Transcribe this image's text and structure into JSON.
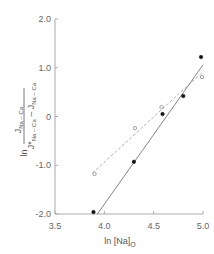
{
  "chart_data": {
    "type": "scatter",
    "title": "",
    "xlabel": "ln [Na]o",
    "ylabel": "ln (J_Na-Ca / (J*_Na-Ca − J_Na-Ca))",
    "xlim": [
      3.5,
      5.0
    ],
    "ylim": [
      -2.0,
      2.0
    ],
    "x_ticks": [
      "3.5",
      "4.0",
      "4.5",
      "5.0"
    ],
    "y_ticks": [
      "2.0",
      "1.0",
      "0",
      "-1.0",
      "-2.0"
    ],
    "grid": false,
    "legend": null,
    "series": [
      {
        "name": "filled circles (solid fit line)",
        "marker": "filled-circle",
        "line": "solid",
        "x": [
          3.89,
          4.3,
          4.59,
          4.8,
          4.98
        ],
        "y": [
          -1.96,
          -0.93,
          0.05,
          0.42,
          1.22
        ],
        "fit": {
          "x": [
            3.93,
            5.0
          ],
          "y": [
            -2.0,
            1.06
          ]
        }
      },
      {
        "name": "open circles (dashed fit line)",
        "marker": "open-circle",
        "line": "dashed",
        "x": [
          3.9,
          4.31,
          4.58,
          4.99
        ],
        "y": [
          -1.18,
          -0.24,
          0.19,
          0.81
        ],
        "fit": {
          "x": [
            3.88,
            5.0
          ],
          "y": [
            -1.16,
            0.92
          ]
        }
      }
    ]
  },
  "axes": {
    "x_label_main": "ln [Na]",
    "x_label_sub": "O",
    "y_label_prefix": "ln",
    "y_label_num": "J",
    "y_label_num_sub": "Na – Ca",
    "y_label_den_star": "J*",
    "y_label_den_sub1": "Na – Ca",
    "y_label_den_minus": " – J",
    "y_label_den_sub2": "Na – Ca",
    "y_ticks": [
      {
        "label": "2.0",
        "value": 2.0
      },
      {
        "label": "1.0",
        "value": 1.0
      },
      {
        "label": "0",
        "value": 0
      },
      {
        "label": "-1.0",
        "value": -1.0
      },
      {
        "label": "-2.0",
        "value": -2.0
      }
    ],
    "x_ticks": [
      {
        "label": "3.5",
        "value": 3.5
      },
      {
        "label": "4.0",
        "value": 4.0
      },
      {
        "label": "4.5",
        "value": 4.5
      },
      {
        "label": "5.0",
        "value": 5.0
      }
    ]
  },
  "colors": {
    "axis": "#aaaaaa",
    "filled_marker": "#111111",
    "open_marker": "#888888",
    "solid_line": "#666666",
    "dashed_line": "#999999"
  }
}
